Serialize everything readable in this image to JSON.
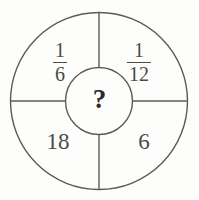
{
  "figure": {
    "type": "circular-quadrant-puzzle",
    "stroke_color": "#5a5a5a",
    "background_color": "#fdfdfc",
    "text_color": "#4a4a4a",
    "center_text_color": "#2b2b2b"
  },
  "center": {
    "value": "?",
    "name": "unknown-value"
  },
  "quadrants": {
    "top_left": {
      "display": "1/6",
      "numerator": "1",
      "denominator": "6"
    },
    "top_right": {
      "display": "1/12",
      "numerator": "1",
      "denominator": "12"
    },
    "bottom_left": {
      "display": "18"
    },
    "bottom_right": {
      "display": "6"
    }
  },
  "geometry": {
    "center_x": 99,
    "center_y": 101,
    "outer_radius": 89,
    "inner_radius": 34,
    "stroke_width": 1.4
  }
}
